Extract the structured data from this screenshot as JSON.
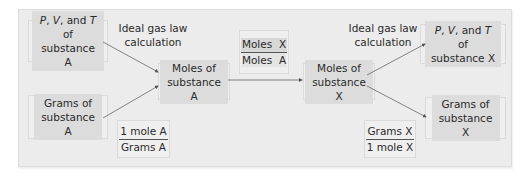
{
  "diagram": {
    "left": {
      "pvt_box": {
        "p": "P",
        "sep1": ", ",
        "v": "V",
        "sep2": ", and ",
        "t": "T",
        "of": " of",
        "line2": "substance A"
      },
      "ideal_gas_label": {
        "line1": "Ideal gas law",
        "line2": "calculation"
      },
      "grams_box": {
        "line1": "Grams of",
        "line2": "substance A"
      },
      "conversion_factor": {
        "numerator": "1 mole A",
        "denominator": "Grams A"
      },
      "moles_box": {
        "line1": "Moles of",
        "line2": "substance A"
      }
    },
    "middle": {
      "mole_ratio": {
        "numerator": "Moles  X",
        "denominator": "Moles  A"
      }
    },
    "right": {
      "moles_box": {
        "line1": "Moles of",
        "line2": "substance X"
      },
      "ideal_gas_label": {
        "line1": "Ideal gas law",
        "line2": "calculation"
      },
      "pvt_box": {
        "p": "P",
        "sep1": ", ",
        "v": "V",
        "sep2": ", and ",
        "t": "T",
        "of": " of",
        "line2": "substance X"
      },
      "grams_box": {
        "line1": "Grams of",
        "line2": "substance X"
      },
      "conversion_factor": {
        "numerator": "Grams X",
        "denominator": "1 mole X"
      }
    },
    "colors": {
      "panel": "#ececec",
      "box_shade": "#dcdcdc",
      "arrow": "#555555"
    }
  }
}
